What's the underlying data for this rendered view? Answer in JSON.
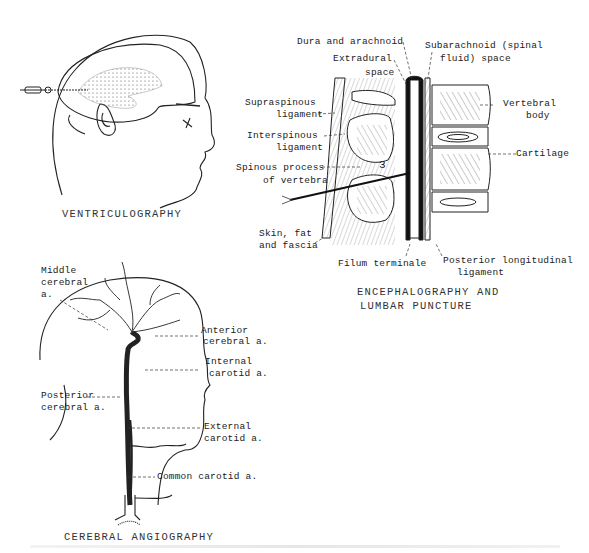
{
  "figures": {
    "ventriculography": {
      "caption": "VENTRICULOGRAPHY"
    },
    "encephalography": {
      "caption_line1": "ENCEPHALOGRAPHY AND",
      "caption_line2": "LUMBAR PUNCTURE",
      "labels": {
        "dura": "Dura and arachnoid",
        "subarachnoid_1": "Subarachnoid (spinal",
        "subarachnoid_2": "fluid) space",
        "extradural_1": "Extradural",
        "extradural_2": "space",
        "supraspinous_1": "Supraspinous",
        "supraspinous_2": "ligament",
        "interspinous_1": "Interspinous",
        "interspinous_2": "ligament",
        "spinous_1": "Spinous process",
        "spinous_2": "of vertebra",
        "skin_1": "Skin, fat",
        "skin_2": "and fascia",
        "vertebral_1": "Vertebral",
        "vertebral_2": "body",
        "cartilage": "Cartilage",
        "filum": "Filum terminale",
        "posterior_1": "Posterior longitudinal",
        "posterior_2": "ligament",
        "vertebra_number": "3"
      }
    },
    "angiography": {
      "caption": "CEREBRAL ANGIOGRAPHY",
      "labels": {
        "middle_1": "Middle",
        "middle_2": "cerebral",
        "middle_3": "a.",
        "anterior_1": "Anterior",
        "anterior_2": "cerebral a.",
        "internal_1": "Internal",
        "internal_2": "carotid a.",
        "posterior_1": "Posterior",
        "posterior_2": "cerebral a.",
        "external_1": "External",
        "external_2": "carotid a.",
        "common": "Common carotid a."
      }
    }
  }
}
